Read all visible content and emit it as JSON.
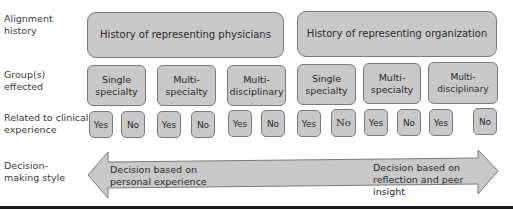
{
  "row_labels": {
    "alignment": "Alignment history",
    "groups": "Group(s) effected",
    "clinical": "Related to clinical experience",
    "decision": "Decision-making style"
  },
  "alignment_history": [
    "History of representing physicians",
    "History of representing organization"
  ],
  "groups": [
    "Single specialty",
    "Multi- specialty",
    "Multi- disciplinary",
    "Single specialty",
    "Multi- specialty",
    "Multi-disciplinary"
  ],
  "clinical": [
    "Yes",
    "No",
    "Yes",
    "No",
    "Yes",
    "No",
    "Yes",
    "No",
    "Yes",
    "No",
    "Yes",
    "No"
  ],
  "decision_arrow": {
    "left_text": "Decision based on personal experience",
    "right_text": "Decision based on reflection and peer insight"
  },
  "colors": {
    "box_fill": "#c8c8c8",
    "box_border": "#7a7a7a",
    "rule": "#1a1a1a"
  }
}
